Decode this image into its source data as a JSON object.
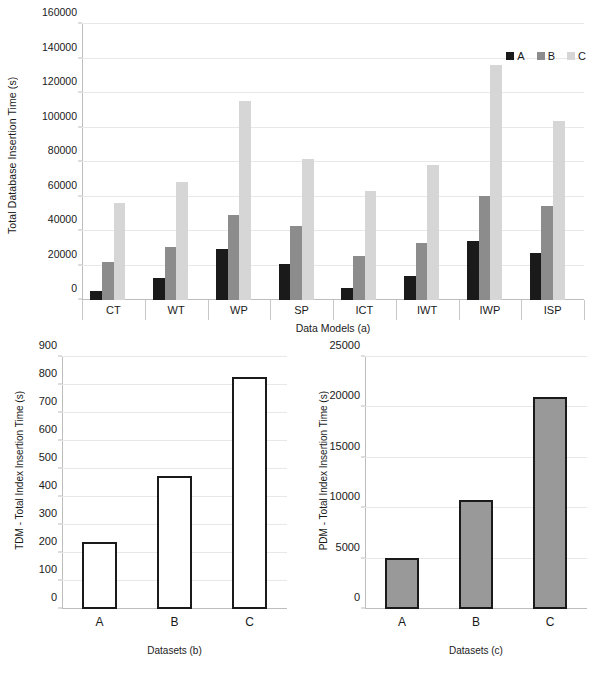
{
  "chart_data": [
    {
      "id": "a",
      "type": "bar",
      "title": "",
      "xlabel": "Data Models (a)",
      "ylabel": "Total Database Insertion Time (s)",
      "categories": [
        "CT",
        "WT",
        "WP",
        "SP",
        "ICT",
        "IWT",
        "IWP",
        "ISP"
      ],
      "series": [
        {
          "name": "A",
          "color": "#1a1a1a",
          "values": [
            5500,
            12500,
            29500,
            21000,
            7000,
            14000,
            34500,
            27000
          ]
        },
        {
          "name": "B",
          "color": "#8c8c8c",
          "values": [
            22000,
            30500,
            49500,
            43000,
            25500,
            33000,
            60500,
            54500
          ]
        },
        {
          "name": "C",
          "color": "#d6d6d6",
          "values": [
            56000,
            68500,
            115500,
            82000,
            63000,
            78500,
            136000,
            104000
          ]
        }
      ],
      "ylim": [
        0,
        160000
      ],
      "yticks": [
        0,
        20000,
        40000,
        60000,
        80000,
        100000,
        120000,
        140000,
        160000
      ],
      "grid": true,
      "legend": {
        "position": "top-right",
        "entries": [
          "A",
          "B",
          "C"
        ]
      }
    },
    {
      "id": "b",
      "type": "bar",
      "title": "",
      "xlabel": "Datasets (b)",
      "ylabel": "TDM - Total Index Insertion Time (s)",
      "categories": [
        "A",
        "B",
        "C"
      ],
      "values": [
        240,
        475,
        827
      ],
      "bar_fill": "#ffffff",
      "bar_stroke": "#1a1a1a",
      "ylim": [
        0,
        900
      ],
      "yticks": [
        0,
        100,
        200,
        300,
        400,
        500,
        600,
        700,
        800,
        900
      ],
      "grid": true,
      "legend": null
    },
    {
      "id": "c",
      "type": "bar",
      "title": "",
      "xlabel": "Datasets (c)",
      "ylabel": "PDM - Total Index Insertion Time (s)",
      "categories": [
        "A",
        "B",
        "C"
      ],
      "values": [
        5100,
        10800,
        21000
      ],
      "bar_fill": "#999999",
      "bar_stroke": "#1a1a1a",
      "ylim": [
        0,
        25000
      ],
      "yticks": [
        0,
        5000,
        10000,
        15000,
        20000,
        25000
      ],
      "grid": true,
      "legend": null
    }
  ]
}
